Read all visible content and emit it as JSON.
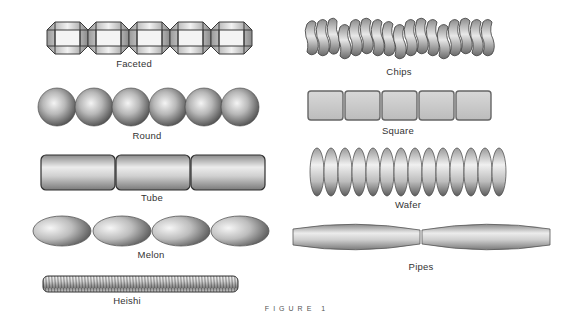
{
  "figure": {
    "caption": "FIGURE 1",
    "background": "#ffffff"
  },
  "beads": [
    {
      "id": "faceted",
      "label": "Faceted",
      "count": 5
    },
    {
      "id": "chips",
      "label": "Chips",
      "count": 17
    },
    {
      "id": "round",
      "label": "Round",
      "count": 6
    },
    {
      "id": "square",
      "label": "Square",
      "count": 5
    },
    {
      "id": "tube",
      "label": "Tube",
      "count": 3
    },
    {
      "id": "wafer",
      "label": "Wafer",
      "count": 14
    },
    {
      "id": "melon",
      "label": "Melon",
      "count": 4
    },
    {
      "id": "pipes",
      "label": "Pipes",
      "count": 2
    },
    {
      "id": "heishi",
      "label": "Heishi",
      "count": 1
    }
  ],
  "colors": {
    "outline": "#3a3a3a",
    "highlight": "#f2f2f2",
    "mid": "#bdbdbd",
    "shadow": "#6e6e6e"
  }
}
